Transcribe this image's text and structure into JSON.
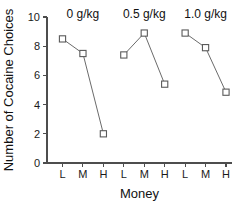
{
  "chart_data": {
    "type": "line",
    "title": "",
    "xlabel": "Money",
    "ylabel": "Number of Cocaine Choices",
    "ylim": [
      0,
      10
    ],
    "yticks": [
      0,
      2,
      4,
      6,
      8,
      10
    ],
    "ytick_labels": [
      "0",
      "2",
      "4",
      "6",
      "8",
      "10"
    ],
    "categories": [
      "L",
      "M",
      "H"
    ],
    "grid": false,
    "legend_position": "none",
    "marker": "open-square",
    "groups": [
      {
        "label": "0 g/kg",
        "points": [
          {
            "x": "L",
            "y": 8.5
          },
          {
            "x": "M",
            "y": 7.5
          },
          {
            "x": "H",
            "y": 2.0
          }
        ]
      },
      {
        "label": "0.5 g/kg",
        "points": [
          {
            "x": "L",
            "y": 7.4
          },
          {
            "x": "M",
            "y": 8.9
          },
          {
            "x": "H",
            "y": 5.4
          }
        ]
      },
      {
        "label": "1.0 g/kg",
        "points": [
          {
            "x": "L",
            "y": 8.9
          },
          {
            "x": "M",
            "y": 7.9
          },
          {
            "x": "H",
            "y": 4.85
          }
        ]
      }
    ],
    "xtick_labels": [
      "L",
      "M",
      "H",
      "L",
      "M",
      "H",
      "L",
      "M",
      "H"
    ],
    "colors": {
      "axis": "#4d4d4d",
      "line": "#6b6b6b",
      "marker_stroke": "#5a5a5a",
      "marker_fill": "#ffffff",
      "text": "#111111",
      "background": "#ffffff"
    }
  }
}
